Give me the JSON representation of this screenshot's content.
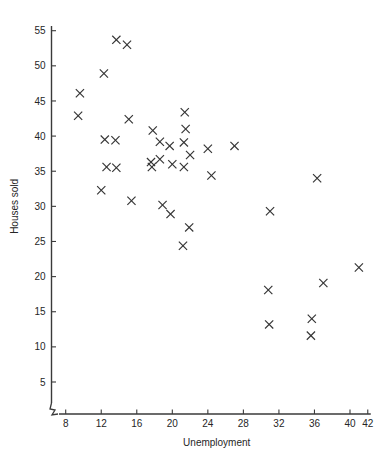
{
  "chart_data": {
    "type": "scatter",
    "title": "",
    "xlabel": "Unemployment",
    "ylabel": "Houses sold",
    "xlim": [
      6.8,
      42.6
    ],
    "ylim": [
      2.0,
      57.0
    ],
    "xticks": [
      8,
      12,
      16,
      20,
      24,
      28,
      32,
      36,
      40,
      42
    ],
    "yticks": [
      5,
      10,
      15,
      20,
      25,
      30,
      35,
      40,
      45,
      50,
      55
    ],
    "grid": false,
    "legend": null,
    "marker_style": "x",
    "axis_break": true,
    "points": [
      {
        "x": 9.6,
        "y": 46.1
      },
      {
        "x": 9.4,
        "y": 42.9
      },
      {
        "x": 12.3,
        "y": 48.9
      },
      {
        "x": 13.7,
        "y": 53.7
      },
      {
        "x": 14.9,
        "y": 53.0
      },
      {
        "x": 12.4,
        "y": 39.5
      },
      {
        "x": 13.6,
        "y": 39.4
      },
      {
        "x": 15.1,
        "y": 42.4
      },
      {
        "x": 12.6,
        "y": 35.6
      },
      {
        "x": 13.7,
        "y": 35.5
      },
      {
        "x": 12.0,
        "y": 32.3
      },
      {
        "x": 15.4,
        "y": 30.8
      },
      {
        "x": 17.8,
        "y": 40.8
      },
      {
        "x": 18.6,
        "y": 39.2
      },
      {
        "x": 17.6,
        "y": 36.3
      },
      {
        "x": 17.7,
        "y": 35.6
      },
      {
        "x": 18.6,
        "y": 36.7
      },
      {
        "x": 19.7,
        "y": 38.6
      },
      {
        "x": 20.0,
        "y": 36.0
      },
      {
        "x": 18.9,
        "y": 30.2
      },
      {
        "x": 19.8,
        "y": 28.9
      },
      {
        "x": 21.4,
        "y": 43.4
      },
      {
        "x": 21.5,
        "y": 41.0
      },
      {
        "x": 21.3,
        "y": 39.1
      },
      {
        "x": 22.0,
        "y": 37.3
      },
      {
        "x": 21.3,
        "y": 35.6
      },
      {
        "x": 21.9,
        "y": 27.0
      },
      {
        "x": 21.2,
        "y": 24.4
      },
      {
        "x": 24.0,
        "y": 38.2
      },
      {
        "x": 27.0,
        "y": 38.6
      },
      {
        "x": 24.4,
        "y": 34.4
      },
      {
        "x": 31.0,
        "y": 29.3
      },
      {
        "x": 36.3,
        "y": 34.0
      },
      {
        "x": 30.8,
        "y": 18.1
      },
      {
        "x": 37.0,
        "y": 19.1
      },
      {
        "x": 41.0,
        "y": 21.3
      },
      {
        "x": 30.9,
        "y": 13.2
      },
      {
        "x": 35.7,
        "y": 14.0
      },
      {
        "x": 35.6,
        "y": 11.6
      }
    ]
  },
  "labels": {
    "x_axis_title": "Unemployment",
    "y_axis_title": "Houses sold"
  }
}
